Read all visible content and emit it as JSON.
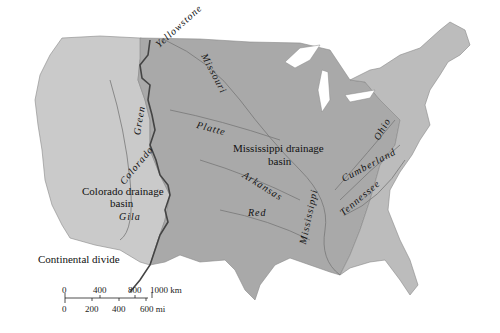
{
  "map": {
    "subject": "Drainage basins of the United States",
    "colors": {
      "land_west": "#c9c9c9",
      "land_mississippi": "#a8a8a8",
      "land_east": "#bdbdbd",
      "water": "#ffffff",
      "rivers": "#777777",
      "divide_line": "#444444"
    }
  },
  "labels": {
    "basins": {
      "mississippi_line1": "Mississippi drainage",
      "mississippi_line2": "basin",
      "colorado_line1": "Colorado drainage",
      "colorado_line2": "basin"
    },
    "rivers": {
      "yellowstone": "Yellowstone",
      "missouri": "Missouri",
      "green": "Green",
      "platte": "Platte",
      "colorado": "Colorado",
      "arkansas": "Arkansas",
      "red": "Red",
      "mississippi": "Mississippi",
      "ohio": "Ohio",
      "cumberland": "Cumberland",
      "tennessee": "Tennessee",
      "gila": "Gila"
    },
    "continental_divide": "Continental divide"
  },
  "scale_bar": {
    "km_ticks": [
      "0",
      "400",
      "800",
      "1000 km"
    ],
    "mi_ticks": [
      "0",
      "200",
      "400",
      "600 mi"
    ]
  }
}
